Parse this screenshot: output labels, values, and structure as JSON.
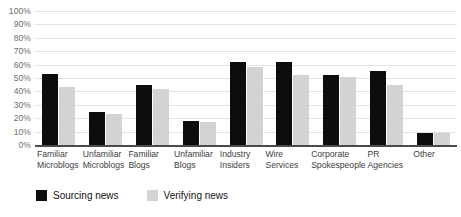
{
  "chart_data": {
    "type": "bar",
    "title": "",
    "subtitle": "",
    "xlabel": "",
    "ylabel": "",
    "ylim": [
      0,
      100
    ],
    "ytick_labels": [
      "100%",
      "90%",
      "80%",
      "70%",
      "60%",
      "50%",
      "40%",
      "30%",
      "20%",
      "10%",
      "0%"
    ],
    "ytick_values": [
      100,
      90,
      80,
      70,
      60,
      50,
      40,
      30,
      20,
      10,
      0
    ],
    "grid": true,
    "legend_position": "bottom-left",
    "categories": [
      "Familiar Microblogs",
      "Unfamiliar Microblogs",
      "Familiar Blogs",
      "Unfamiliar Blogs",
      "Industry Insiders",
      "Wire Services",
      "Corporate Spokespeople",
      "PR Agencies",
      "Other"
    ],
    "category_lines": [
      [
        "Familiar",
        "Microblogs"
      ],
      [
        "Unfamiliar",
        "Microblogs"
      ],
      [
        "Familiar",
        "Blogs"
      ],
      [
        "Unfamiliar",
        "Blogs"
      ],
      [
        "Industry",
        "Insiders"
      ],
      [
        "Wire",
        "Services"
      ],
      [
        "Corporate",
        "Spokespeople"
      ],
      [
        "PR",
        "Agencies"
      ],
      [
        "Other",
        ""
      ]
    ],
    "series": [
      {
        "name": "Sourcing news",
        "color": "#0d0d0d",
        "values": [
          53,
          25,
          45,
          18,
          62,
          62,
          52,
          55,
          9
        ]
      },
      {
        "name": "Verifying news",
        "color": "#d3d3d3",
        "values": [
          43,
          23,
          42,
          17,
          58,
          52,
          51,
          45,
          9
        ]
      }
    ]
  }
}
